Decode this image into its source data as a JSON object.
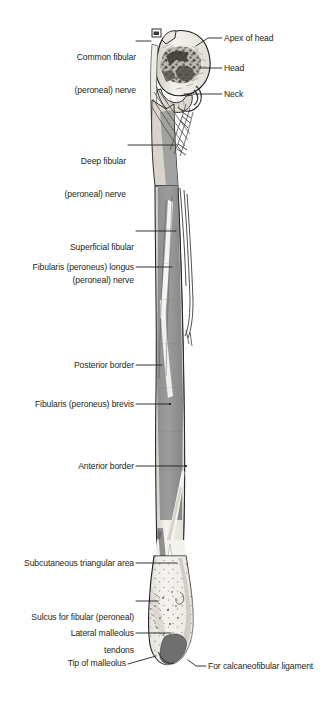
{
  "figure": {
    "background_color": "#ffffff",
    "width": 321,
    "height": 721
  },
  "palette": {
    "text": "#231f20",
    "leader_line": "#231f20",
    "bone_outline": "#1a1a1a",
    "bone_light": "#f2f0ec",
    "bone_cortex": "#dedad2",
    "muscle_gray": "#989898",
    "muscle_gray_dark": "#7c7c7c",
    "head_mottle_dark": "#4a4a4a",
    "facet_dark": "#6e6e6e",
    "nerve_line": "#4f4f4f"
  },
  "labels": [
    {
      "id": "common-fibular-nerve",
      "side": "left",
      "lines": [
        "Common fibular",
        "(peroneal) nerve"
      ],
      "text": "Common fibular\n(peroneal) nerve"
    },
    {
      "id": "deep-fibular-nerve",
      "side": "left",
      "lines": [
        "Deep fibular",
        "(peroneal) nerve"
      ],
      "text": "Deep fibular\n(peroneal) nerve"
    },
    {
      "id": "superficial-fibular-nerve",
      "side": "left",
      "lines": [
        "Superficial fibular",
        "(peroneal) nerve"
      ],
      "text": "Superficial fibular\n(peroneal) nerve"
    },
    {
      "id": "fibularis-longus",
      "side": "left",
      "lines": [
        "Fibularis (peroneus) longus"
      ],
      "text": "Fibularis (peroneus) longus"
    },
    {
      "id": "posterior-border",
      "side": "left",
      "lines": [
        "Posterior border"
      ],
      "text": "Posterior border"
    },
    {
      "id": "fibularis-brevis",
      "side": "left",
      "lines": [
        "Fibularis (peroneus) brevis"
      ],
      "text": "Fibularis (peroneus) brevis"
    },
    {
      "id": "anterior-border",
      "side": "left",
      "lines": [
        "Anterior border"
      ],
      "text": "Anterior border"
    },
    {
      "id": "subcutaneous-triangular-area",
      "side": "left",
      "lines": [
        "Subcutaneous triangular area"
      ],
      "text": "Subcutaneous triangular area"
    },
    {
      "id": "sulcus-fibular-tendons",
      "side": "left",
      "lines": [
        "Sulcus for fibular (peroneal)",
        "tendons"
      ],
      "text": "Sulcus for fibular (peroneal)\ntendons"
    },
    {
      "id": "lateral-malleolus",
      "side": "left",
      "lines": [
        "Lateral malleolus"
      ],
      "text": "Lateral malleolus"
    },
    {
      "id": "tip-of-malleolus",
      "side": "left",
      "lines": [
        "Tip of malleolus"
      ],
      "text": "Tip of malleolus"
    },
    {
      "id": "apex-of-head",
      "side": "right",
      "lines": [
        "Apex of head"
      ],
      "text": "Apex of head"
    },
    {
      "id": "head",
      "side": "right",
      "lines": [
        "Head"
      ],
      "text": "Head"
    },
    {
      "id": "neck",
      "side": "right",
      "lines": [
        "Neck"
      ],
      "text": "Neck"
    },
    {
      "id": "calcaneofibular-ligament",
      "side": "right",
      "lines": [
        "For calcaneofibular ligament"
      ],
      "text": "For calcaneofibular ligament"
    }
  ],
  "label_text": {
    "common_fibular_nerve_l1": "Common fibular",
    "common_fibular_nerve_l2": "(peroneal) nerve",
    "deep_fibular_nerve_l1": "Deep fibular",
    "deep_fibular_nerve_l2": "(peroneal) nerve",
    "superficial_fibular_nerve_l1": "Superficial fibular",
    "superficial_fibular_nerve_l2": "(peroneal) nerve",
    "fibularis_longus": "Fibularis (peroneus) longus",
    "posterior_border": "Posterior border",
    "fibularis_brevis": "Fibularis (peroneus) brevis",
    "anterior_border": "Anterior border",
    "subcutaneous_triangular_area": "Subcutaneous triangular area",
    "sulcus_fibular_tendons_l1": "Sulcus for fibular (peroneal)",
    "sulcus_fibular_tendons_l2": "tendons",
    "lateral_malleolus": "Lateral malleolus",
    "tip_of_malleolus": "Tip of malleolus",
    "apex_of_head": "Apex of head",
    "head": "Head",
    "neck": "Neck",
    "calcaneofibular_ligament": "For calcaneofibular ligament"
  }
}
